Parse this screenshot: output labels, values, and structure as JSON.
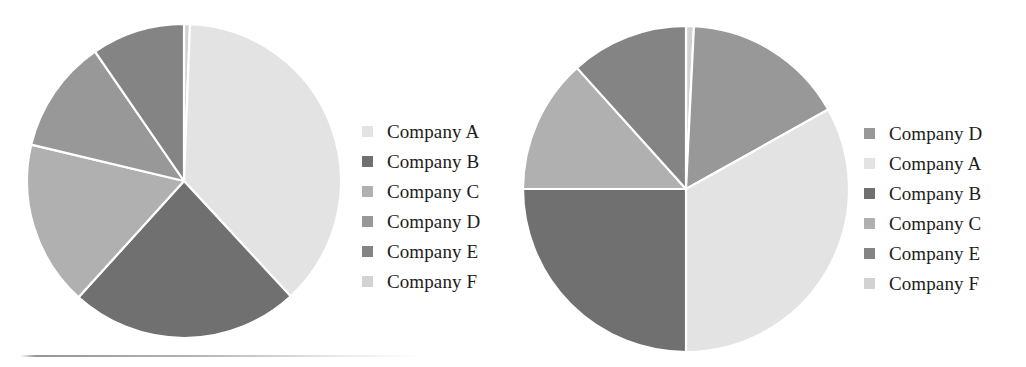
{
  "figure": {
    "background_color": "#ffffff",
    "bottom_rule": {
      "name": "horizontal-rule",
      "color": "#8f8f8f"
    }
  },
  "palette": {
    "Company A": "#e3e3e3",
    "Company B": "#707070",
    "Company C": "#b0b0b0",
    "Company D": "#989898",
    "Company E": "#848484",
    "Company F": "#d2d2d2"
  },
  "charts": [
    {
      "id": "pie-left",
      "name": "pie-chart-left",
      "legend": {
        "name": "legend-left",
        "position": "right",
        "items": [
          {
            "label": "Company A",
            "color": "#e3e3e3"
          },
          {
            "label": "Company B",
            "color": "#707070"
          },
          {
            "label": "Company C",
            "color": "#b0b0b0"
          },
          {
            "label": "Company D",
            "color": "#989898"
          },
          {
            "label": "Company E",
            "color": "#848484"
          },
          {
            "label": "Company F",
            "color": "#d2d2d2"
          }
        ]
      }
    },
    {
      "id": "pie-right",
      "name": "pie-chart-right",
      "legend": {
        "name": "legend-right",
        "position": "right",
        "items": [
          {
            "label": "Company D",
            "color": "#989898"
          },
          {
            "label": "Company A",
            "color": "#e3e3e3"
          },
          {
            "label": "Company B",
            "color": "#707070"
          },
          {
            "label": "Company C",
            "color": "#b0b0b0"
          },
          {
            "label": "Company E",
            "color": "#848484"
          },
          {
            "label": "Company F",
            "color": "#d2d2d2"
          }
        ]
      }
    }
  ],
  "chart_data": [
    {
      "type": "pie",
      "id": "pie-left",
      "title": "",
      "legend_position": "right",
      "start_angle_deg": 0,
      "direction": "clockwise",
      "labels": [
        "Company F",
        "Company A",
        "Company B",
        "Company C",
        "Company D",
        "Company E"
      ],
      "values": [
        0.6,
        37.5,
        23.6,
        17.0,
        11.7,
        9.6
      ],
      "units": "percent",
      "slice_order_clockwise_from_12": [
        {
          "label": "Company F",
          "percent": 0.6,
          "color": "#d2d2d2",
          "start_deg": 0.0,
          "end_deg": 2.2
        },
        {
          "label": "Company A",
          "percent": 37.5,
          "color": "#e3e3e3",
          "start_deg": 2.2,
          "end_deg": 137.2
        },
        {
          "label": "Company B",
          "percent": 23.6,
          "color": "#707070",
          "start_deg": 137.2,
          "end_deg": 222.2
        },
        {
          "label": "Company C",
          "percent": 17.0,
          "color": "#b0b0b0",
          "start_deg": 222.2,
          "end_deg": 283.4
        },
        {
          "label": "Company D",
          "percent": 11.7,
          "color": "#989898",
          "start_deg": 283.4,
          "end_deg": 325.5
        },
        {
          "label": "Company E",
          "percent": 9.6,
          "color": "#848484",
          "start_deg": 325.5,
          "end_deg": 360.0
        }
      ]
    },
    {
      "type": "pie",
      "id": "pie-right",
      "title": "",
      "legend_position": "right",
      "start_angle_deg": 0,
      "direction": "clockwise",
      "labels": [
        "Company F",
        "Company D",
        "Company A",
        "Company B",
        "Company C",
        "Company E"
      ],
      "values": [
        0.8,
        16.1,
        33.1,
        25.0,
        13.3,
        11.7
      ],
      "units": "percent",
      "slice_order_clockwise_from_12": [
        {
          "label": "Company F",
          "percent": 0.8,
          "color": "#d2d2d2",
          "start_deg": 0.0,
          "end_deg": 2.8
        },
        {
          "label": "Company D",
          "percent": 16.1,
          "color": "#989898",
          "start_deg": 2.8,
          "end_deg": 60.8
        },
        {
          "label": "Company A",
          "percent": 33.1,
          "color": "#e3e3e3",
          "start_deg": 60.8,
          "end_deg": 180.0
        },
        {
          "label": "Company B",
          "percent": 25.0,
          "color": "#707070",
          "start_deg": 180.0,
          "end_deg": 270.0
        },
        {
          "label": "Company C",
          "percent": 13.3,
          "color": "#b0b0b0",
          "start_deg": 270.0,
          "end_deg": 318.0
        },
        {
          "label": "Company E",
          "percent": 11.7,
          "color": "#848484",
          "start_deg": 318.0,
          "end_deg": 360.0
        }
      ]
    }
  ]
}
